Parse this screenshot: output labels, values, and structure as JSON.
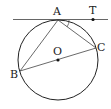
{
  "diagram": {
    "type": "geometry",
    "points": {
      "A": {
        "label": "A",
        "x": 58,
        "y": 20
      },
      "T": {
        "label": "T",
        "x": 93,
        "y": 20
      },
      "B": {
        "label": "B",
        "x": 20,
        "y": 71
      },
      "C": {
        "label": "C",
        "x": 96,
        "y": 48
      },
      "O": {
        "label": "O",
        "x": 58,
        "y": 60
      }
    },
    "circle": {
      "cx": 58,
      "cy": 60,
      "r": 40
    },
    "tangent_line": {
      "x1": 13,
      "x2": 108,
      "y": 20
    },
    "colors": {
      "stroke": "#222222",
      "tangent": "#666666"
    }
  }
}
